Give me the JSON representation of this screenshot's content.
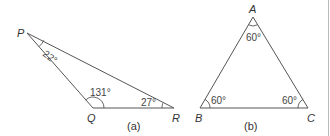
{
  "figure_a": {
    "caption": "(a)",
    "vertices": {
      "P": {
        "label": "P",
        "x": 27,
        "y": 33
      },
      "Q": {
        "label": "Q",
        "x": 93,
        "y": 108
      },
      "R": {
        "label": "R",
        "x": 174,
        "y": 108
      }
    },
    "angles": {
      "P": "22°",
      "Q": "131°",
      "R": "27°"
    }
  },
  "figure_b": {
    "caption": "(b)",
    "vertices": {
      "A": {
        "label": "A",
        "x": 253,
        "y": 17
      },
      "B": {
        "label": "B",
        "x": 200,
        "y": 108
      },
      "C": {
        "label": "C",
        "x": 308,
        "y": 108
      }
    },
    "angles": {
      "A": "60°",
      "B": "60°",
      "C": "60°"
    }
  },
  "colors": {
    "line": "#555555",
    "text": "#333333",
    "border": "#bbbbbb"
  }
}
